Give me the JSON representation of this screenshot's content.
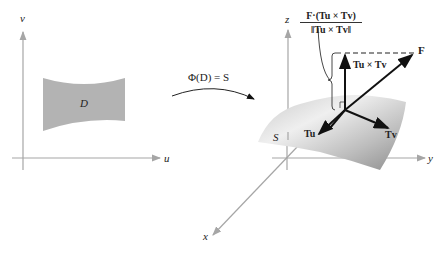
{
  "figure": {
    "left_plane": {
      "axis_v_label": "v",
      "axis_u_label": "u",
      "region_label": "D"
    },
    "mapping": {
      "label": "Φ(D) = S"
    },
    "right_space": {
      "axis_z_label": "z",
      "axis_y_label": "y",
      "axis_x_label": "x",
      "surface_label": "S",
      "normal_component_formula": {
        "numerator": "F·(Tu × Tv)",
        "denominator": "‖Tu × Tv‖"
      },
      "vectors": {
        "normal": "Tu × Tv",
        "field": "F",
        "tangent_u": "Tu",
        "tangent_v": "Tv"
      }
    },
    "colors": {
      "region_fill": "#b3b3b3",
      "axis": "#a6a6a6",
      "vector": "#111111",
      "surface_light": "#e6e6e6",
      "surface_dark": "#8a8a8a"
    }
  }
}
